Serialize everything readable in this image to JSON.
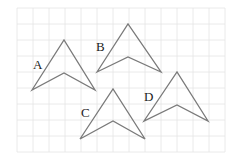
{
  "figure": {
    "grid": {
      "x0": 17,
      "y0": 8,
      "cell": 16,
      "cols": 13,
      "rows": 9,
      "color": "#e4e4e4"
    },
    "stroke_color": "#7a7a7a",
    "shapes": [
      {
        "label": "A",
        "points": [
          [
            32,
            90
          ],
          [
            64,
            40
          ],
          [
            95,
            90
          ],
          [
            64,
            73
          ]
        ],
        "label_pos": [
          33,
          58
        ]
      },
      {
        "label": "B",
        "points": [
          [
            97,
            72
          ],
          [
            128,
            24
          ],
          [
            161,
            72
          ],
          [
            128,
            57
          ]
        ],
        "label_pos": [
          96,
          40
        ]
      },
      {
        "label": "C",
        "points": [
          [
            80,
            139
          ],
          [
            113,
            89
          ],
          [
            145,
            139
          ],
          [
            113,
            121
          ]
        ],
        "label_pos": [
          81,
          106
        ]
      },
      {
        "label": "D",
        "points": [
          [
            144,
            121
          ],
          [
            177,
            72
          ],
          [
            208,
            121
          ],
          [
            177,
            105
          ]
        ],
        "label_pos": [
          144,
          90
        ]
      }
    ]
  }
}
